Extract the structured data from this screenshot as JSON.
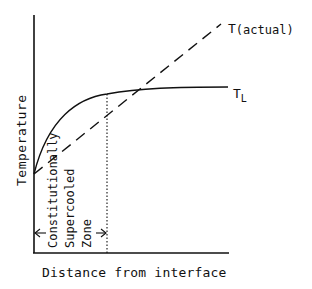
{
  "diagram": {
    "axes": {
      "y_label": "Temperature",
      "x_label": "Distance from interface"
    },
    "curves": {
      "actual_label_main": "T",
      "actual_label_suffix": "(actual)",
      "liquidus_label_main": "T",
      "liquidus_label_sub": "L"
    },
    "zone": {
      "line1": "Constitutionally",
      "line2": "Supercooled",
      "line3": "Zone"
    },
    "colors": {
      "ink": "#111111",
      "background": "#ffffff"
    }
  }
}
